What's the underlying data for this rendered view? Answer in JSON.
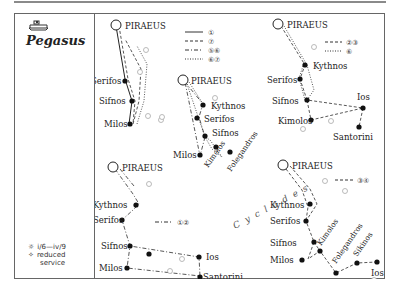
{
  "header": {
    "ship_icon": "ferry-ship-icon",
    "title": "Pegasus"
  },
  "legend": {
    "season_icon": "sun-icon",
    "season": "i/6—iv/9",
    "reduced_icon": "diamond-sun-icon",
    "reduced_line1": "reduced",
    "reduced_line2": "service"
  },
  "route_key": [
    {
      "style": "solid",
      "label": "①"
    },
    {
      "style": "dashed",
      "label": "⑦"
    },
    {
      "style": "dashdot",
      "label": "⑤⑥"
    },
    {
      "style": "dotted",
      "label": "⑥⑦"
    }
  ],
  "maps": [
    {
      "id": "map-1",
      "ports": [
        "PIRAEUS",
        "Serifos",
        "Sifnos",
        "Milos"
      ]
    },
    {
      "id": "map-2",
      "ports": [
        "PIRAEUS",
        "Kythnos",
        "Serifos",
        "Sifnos",
        "Milos",
        "Kimolos",
        "Folegandros"
      ]
    },
    {
      "id": "map-3",
      "key": [
        {
          "style": "dashed",
          "label": "②③"
        },
        {
          "style": "dotted",
          "label": "⑥"
        }
      ],
      "ports": [
        "PIRAEUS",
        "Kythnos",
        "Serifos",
        "Sifnos",
        "Ios",
        "Kimolos",
        "Santorini"
      ]
    },
    {
      "id": "map-4",
      "key": [
        {
          "style": "dashdot",
          "label": "①②"
        }
      ],
      "ports": [
        "PIRAEUS",
        "Kythnos",
        "Serifos",
        "Sifnos",
        "Ios",
        "Milos",
        "Santorini"
      ]
    },
    {
      "id": "map-5",
      "key": [
        {
          "style": "dashed",
          "label": "③④"
        }
      ],
      "ports": [
        "PIRAEUS",
        "Kythnos",
        "Serifos",
        "Sifnos",
        "Milos",
        "Kimolos",
        "Folegandros",
        "Sikinos",
        "Ios"
      ]
    }
  ],
  "region_label": "Cyclades"
}
